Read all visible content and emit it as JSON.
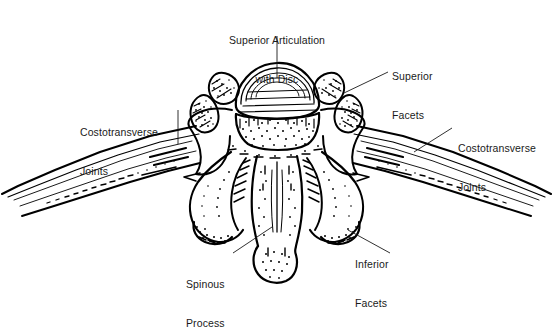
{
  "figure": {
    "style": "black-and-white line drawing with stipple shading",
    "background_color": "#ffffff",
    "ink_color": "#000000",
    "text_color": "#1a1a1a"
  },
  "labels": {
    "superior_articulation": {
      "line1": "Superior Articulation",
      "line2": "with Disc"
    },
    "superior_facets": {
      "line1": "Superior",
      "line2": "Facets"
    },
    "costotransverse_left": {
      "line1": "Costotransverse",
      "line2": "Joints"
    },
    "costotransverse_right": {
      "line1": "Costotransverse",
      "line2": "Joints"
    },
    "spinous_process": {
      "line1": "Spinous",
      "line2": "Process"
    },
    "inferior_facets": {
      "line1": "Inferior",
      "line2": "Facets"
    }
  },
  "anatomy_parts": [
    "vertebral body with intervertebral disc",
    "superior articular facets",
    "transverse processes",
    "costotransverse joints",
    "ribs",
    "pedicles",
    "laminae",
    "inferior articular facets",
    "spinous process"
  ]
}
